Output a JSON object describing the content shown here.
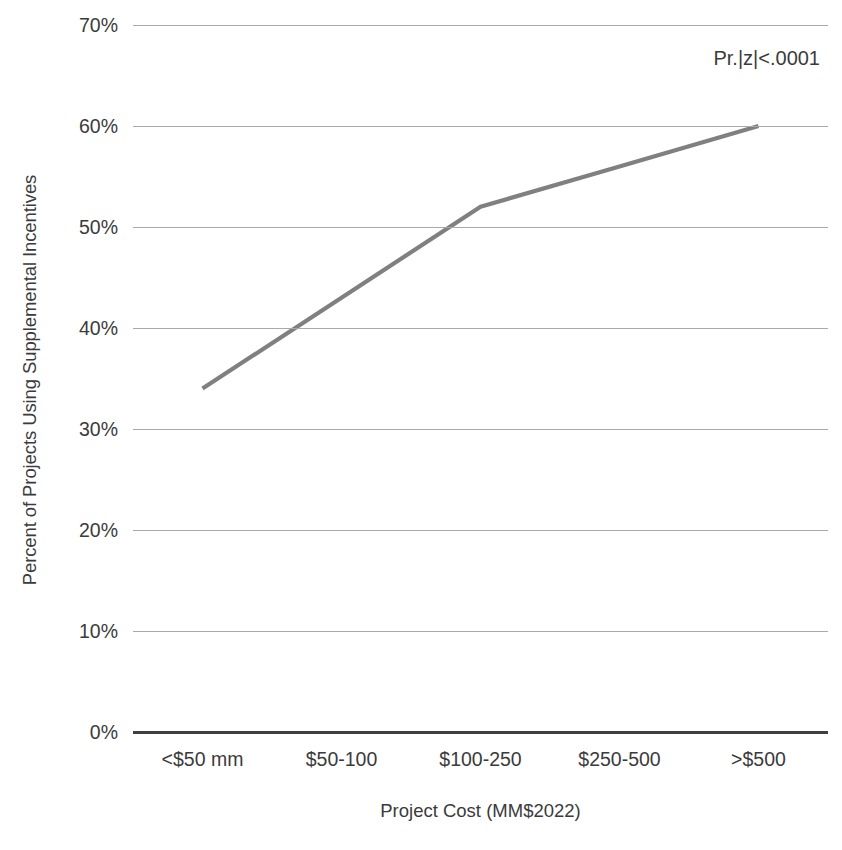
{
  "chart_data": {
    "type": "line",
    "title": "",
    "subtitle": "",
    "categories": [
      "<$50 mm",
      "$50-100",
      "$100-250",
      "$250-500",
      ">$500"
    ],
    "values": [
      34,
      43,
      52,
      56,
      60
    ],
    "series": [
      {
        "name": "Percent of Projects Using Supplemental Incentives",
        "values": [
          34,
          43,
          52,
          56,
          60
        ],
        "color": "#808080"
      }
    ],
    "xlabel": "Project Cost (MM$2022)",
    "ylabel": "Percent of Projects Using Supplemental Incentives",
    "ylim": [
      0,
      70
    ],
    "ytick_values": [
      0,
      10,
      20,
      30,
      40,
      50,
      60,
      70
    ],
    "ytick_labels": [
      "0%",
      "10%",
      "20%",
      "30%",
      "40%",
      "50%",
      "60%",
      "70%"
    ],
    "grid": true,
    "grid_axis": "y",
    "legend": false,
    "legend_position": "none",
    "markers": false,
    "annotations": [
      {
        "text": "Pr.|z|<.0001",
        "position": "top-right"
      }
    ],
    "colors": {
      "series_line": "#808080",
      "gridline": "#a9a9a9",
      "axis_baseline": "#3f3f3f",
      "text": "#3b3b3b",
      "background": "#ffffff"
    }
  }
}
